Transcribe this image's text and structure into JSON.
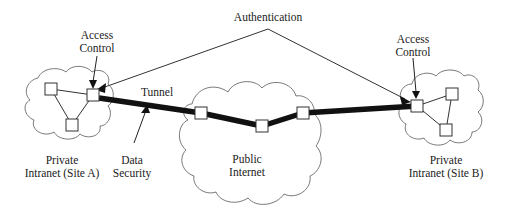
{
  "diagram": {
    "labels": {
      "authentication": "Authentication",
      "access_control_left_line1": "Access",
      "access_control_left_line2": "Control",
      "access_control_right_line1": "Access",
      "access_control_right_line2": "Control",
      "tunnel": "Tunnel",
      "data_security_line1": "Data",
      "data_security_line2": "Security",
      "site_a_line1": "Private",
      "site_a_line2": "Intranet (Site A)",
      "public_internet_line1": "Public",
      "public_internet_line2": "Internet",
      "site_b_line1": "Private",
      "site_b_line2": "Intranet (Site B)"
    },
    "clouds": [
      {
        "id": "site-a",
        "name": "Private Intranet (Site A)"
      },
      {
        "id": "public-internet",
        "name": "Public Internet"
      },
      {
        "id": "site-b",
        "name": "Private Intranet (Site B)"
      }
    ],
    "nodes": {
      "site_a": 3,
      "public_internet": 3,
      "site_b": 3
    },
    "colors": {
      "line": "#333333",
      "tunnel": "#111111",
      "background": "#ffffff"
    }
  }
}
